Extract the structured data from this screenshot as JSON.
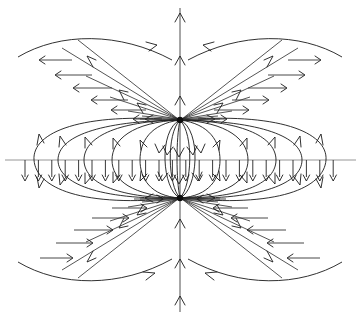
{
  "figure": {
    "kind": "vector-field-diagram",
    "background_color": "#ffffff",
    "line_color": "#1a1a1a",
    "axis_color": "#8a8a8a",
    "width": 360,
    "height": 318
  },
  "chart_data": {
    "type": "scatter",
    "subtitle": "",
    "xlabel": "",
    "ylabel": "",
    "xlim": [
      0,
      360
    ],
    "ylim": [
      318,
      0
    ],
    "grid": false,
    "legend": "none",
    "annotations": [],
    "poles": [
      {
        "name": "upper-pole",
        "role": "sink",
        "x": 180,
        "y": 120,
        "polarity": "in"
      },
      {
        "name": "lower-pole",
        "role": "source",
        "x": 180,
        "y": 198,
        "polarity": "out"
      }
    ],
    "axes": {
      "horizontal": {
        "y": 160,
        "x_start": 5,
        "x_end": 356,
        "arrow_direction": "down",
        "tick_count": 24,
        "tick_start_x": 25,
        "tick_spacing": 13.4,
        "tick_length": 21
      },
      "vertical": {
        "x": 180,
        "y_top": 6,
        "y_bottom": 312,
        "arrow_direction": "up",
        "arrow_count": 6
      }
    },
    "loop_count_per_side": 6,
    "diagonal_ray_count": 2,
    "horizontal_arrow_rows": 16
  }
}
